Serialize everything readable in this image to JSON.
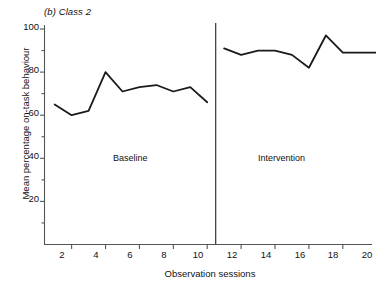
{
  "chart_data": {
    "type": "line",
    "title": "(b) Class 2",
    "title_prefix": "(b)",
    "title_name": "Class 2",
    "xlabel": "Observation sessions",
    "ylabel": "Mean percentage on-task behaviour",
    "xlim": [
      0,
      21
    ],
    "ylim": [
      0,
      100
    ],
    "xticks": [
      2,
      4,
      6,
      8,
      10,
      12,
      14,
      16,
      18,
      20
    ],
    "yticks": [
      20,
      40,
      60,
      80,
      100
    ],
    "yticks_minor": [
      10,
      30,
      50,
      70,
      90
    ],
    "grid": false,
    "legend": "none",
    "line_color": "#1a1a1a",
    "axis_color": "#555555",
    "x": [
      1,
      2,
      3,
      4,
      5,
      6,
      7,
      8,
      9,
      10,
      11,
      12,
      13,
      14,
      15,
      16,
      17,
      18,
      19,
      20
    ],
    "series": [
      {
        "name": "Baseline",
        "x": [
          1,
          2,
          3,
          4,
          5,
          6,
          7,
          8,
          9,
          10
        ],
        "values": [
          65,
          60,
          62,
          80,
          71,
          73,
          74,
          71,
          73,
          66
        ]
      },
      {
        "name": "Intervention",
        "x": [
          11,
          12,
          13,
          14,
          15,
          16,
          17,
          18,
          19,
          20
        ],
        "values": [
          91,
          88,
          90,
          90,
          88,
          82,
          97,
          89,
          89,
          89
        ]
      }
    ],
    "phase_divider_x": 10.5,
    "annotations": [
      {
        "text": "Baseline",
        "x": 5.5,
        "y": 31
      },
      {
        "text": "Intervention",
        "x": 15.5,
        "y": 31
      }
    ]
  }
}
